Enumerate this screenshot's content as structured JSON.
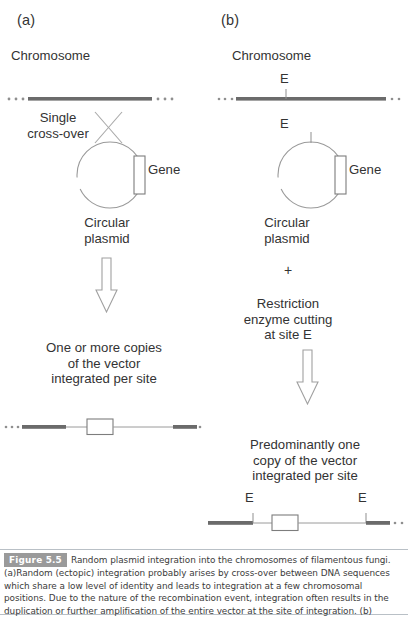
{
  "figure": {
    "panels": [
      {
        "id": "a",
        "label": "(a)",
        "chromosome_label": "Chromosome",
        "crossover_label": "Single\ncross-over",
        "gene_label": "Gene",
        "plasmid_label": "Circular\nplasmid",
        "outcome_label": "One or more copies\nof the vector\nintegrated per site"
      },
      {
        "id": "b",
        "label": "(b)",
        "chromosome_label": "Chromosome",
        "chromosome_site_label": "E",
        "plasmid_site_label": "E",
        "gene_label": "Gene",
        "plasmid_label": "Circular\nplasmid",
        "plus_label": "+",
        "treatment_label": "Restriction\nenzyme cutting\nat site E",
        "outcome_label": "Predominantly one\ncopy of the vector\nintegrated per site",
        "result_site_left_label": "E",
        "result_site_right_label": "E"
      }
    ]
  },
  "caption": {
    "badge": "Figure 5.5",
    "title": "Random plasmid integration into the chromosomes of filamentous fungi.",
    "body": "(a)Random (ectopic) integration probably arises by cross-over between DNA sequences which share a low level of identity and leads to integration at a few chromosomal positions. Due to the nature of the recombination event, integration often results in the duplication or further amplification of the entire vector at the site of integration. (b)"
  },
  "colors": {
    "chromosome_dark": "#6b6b6b",
    "line_thin": "#9a9a9a",
    "outline": "#8a8a8a",
    "text": "#333333",
    "badge_bg": "#9a9a9a",
    "caption_rule": "#b9c0c6"
  }
}
